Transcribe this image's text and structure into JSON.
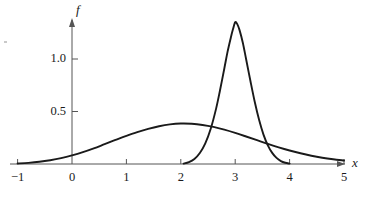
{
  "chart_data": {
    "type": "line",
    "title": "",
    "subtitle": "",
    "xlabel": "x",
    "ylabel": "f",
    "xlim": [
      -1,
      5
    ],
    "ylim": [
      0,
      1.45
    ],
    "grid": false,
    "legend": "none",
    "xticks": [
      {
        "value": -1,
        "label": "−1"
      },
      {
        "value": 0,
        "label": "0"
      },
      {
        "value": 1,
        "label": "1"
      },
      {
        "value": 2,
        "label": "2"
      },
      {
        "value": 3,
        "label": "3"
      },
      {
        "value": 4,
        "label": "4"
      },
      {
        "value": 5,
        "label": "5"
      }
    ],
    "yticks": [
      {
        "value": 0.5,
        "label": "0.5"
      },
      {
        "value": 1.0,
        "label": "1.0"
      }
    ],
    "axis_arrow_x": true,
    "axis_arrow_y": true,
    "line_color": "#1a1a1a",
    "axis_color": "#555555",
    "series": [
      {
        "name": "broad-distribution",
        "peak_x": 2.0,
        "peak_y": 0.385,
        "points": [
          [
            -1.0,
            0.005
          ],
          [
            -0.8,
            0.011
          ],
          [
            -0.6,
            0.021
          ],
          [
            -0.4,
            0.036
          ],
          [
            -0.2,
            0.056
          ],
          [
            0.0,
            0.082
          ],
          [
            0.2,
            0.113
          ],
          [
            0.4,
            0.149
          ],
          [
            0.6,
            0.189
          ],
          [
            0.8,
            0.229
          ],
          [
            1.0,
            0.268
          ],
          [
            1.2,
            0.304
          ],
          [
            1.4,
            0.335
          ],
          [
            1.6,
            0.36
          ],
          [
            1.8,
            0.377
          ],
          [
            2.0,
            0.385
          ],
          [
            2.2,
            0.383
          ],
          [
            2.4,
            0.372
          ],
          [
            2.6,
            0.353
          ],
          [
            2.8,
            0.327
          ],
          [
            3.0,
            0.296
          ],
          [
            3.2,
            0.262
          ],
          [
            3.4,
            0.227
          ],
          [
            3.6,
            0.192
          ],
          [
            3.8,
            0.159
          ],
          [
            4.0,
            0.129
          ],
          [
            4.2,
            0.102
          ],
          [
            4.4,
            0.079
          ],
          [
            4.6,
            0.06
          ],
          [
            4.8,
            0.045
          ],
          [
            5.0,
            0.033
          ]
        ]
      },
      {
        "name": "narrow-peak",
        "peak_x": 3.0,
        "peak_y": 1.35,
        "points": [
          [
            2.05,
            0.004
          ],
          [
            2.15,
            0.018
          ],
          [
            2.25,
            0.048
          ],
          [
            2.35,
            0.104
          ],
          [
            2.45,
            0.196
          ],
          [
            2.55,
            0.336
          ],
          [
            2.65,
            0.53
          ],
          [
            2.72,
            0.7
          ],
          [
            2.8,
            0.91
          ],
          [
            2.86,
            1.07
          ],
          [
            2.92,
            1.205
          ],
          [
            2.96,
            1.285
          ],
          [
            3.0,
            1.35
          ],
          [
            3.04,
            1.33
          ],
          [
            3.08,
            1.275
          ],
          [
            3.14,
            1.155
          ],
          [
            3.2,
            1.0
          ],
          [
            3.28,
            0.79
          ],
          [
            3.36,
            0.59
          ],
          [
            3.44,
            0.418
          ],
          [
            3.52,
            0.28
          ],
          [
            3.6,
            0.178
          ],
          [
            3.68,
            0.106
          ],
          [
            3.76,
            0.058
          ],
          [
            3.84,
            0.028
          ],
          [
            3.92,
            0.012
          ],
          [
            4.0,
            0.004
          ]
        ]
      }
    ]
  },
  "geometry": {
    "origin_x_px": 72,
    "origin_y_px": 164,
    "px_per_unit_x": 54.4,
    "px_per_unit_y": 105
  }
}
